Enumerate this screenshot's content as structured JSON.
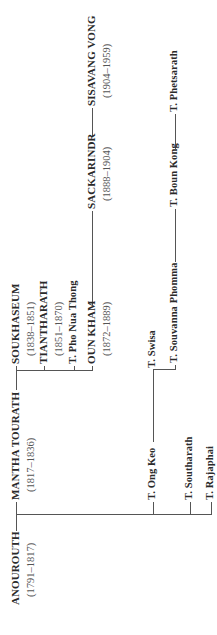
{
  "diagram": {
    "type": "family-tree",
    "orientation": "rotated-90-ccw",
    "line_color": "#555555",
    "text_color": "#2a2a2a",
    "nodes": {
      "anourouth": {
        "name": "ANOUROUTH",
        "dates": "(1791–1817)"
      },
      "mantha_tourath": {
        "name": "MANTHA TOURATH",
        "dates": "(1817–1836)"
      },
      "soukhaseum": {
        "name": "SOUKHASEUM",
        "dates": "(1838–1851)"
      },
      "tiantharath": {
        "name": "TIANTHARATH",
        "dates": "(1851–1870)"
      },
      "pho_nua_thong": {
        "name": "T. Pho Nua Thong"
      },
      "oun_kham": {
        "name": "OUN KHAM",
        "dates": "(1872–1889)"
      },
      "sackarindr": {
        "name": "SACKARINDR",
        "dates": "(1888–1904)"
      },
      "sisavang_vong": {
        "name": "SISAVANG VONG",
        "dates": "(1904–1959)"
      },
      "ong_keo": {
        "name": "T. Ong Keo"
      },
      "swisa": {
        "name": "T. Swisa"
      },
      "souvanna_phomma": {
        "name": "T. Souvanna Phomma"
      },
      "boun_kong": {
        "name": "T. Boun Kong"
      },
      "phetsarath": {
        "name": "T. Phetsarath"
      },
      "southarath": {
        "name": "T. Southarath"
      },
      "rajaphai": {
        "name": "T. Rajaphai"
      }
    },
    "edges": [
      [
        "anourouth",
        "mantha_tourath"
      ],
      [
        "anourouth",
        "ong_keo"
      ],
      [
        "anourouth",
        "southarath"
      ],
      [
        "anourouth",
        "rajaphai"
      ],
      [
        "mantha_tourath",
        "soukhaseum"
      ],
      [
        "mantha_tourath",
        "tiantharath"
      ],
      [
        "mantha_tourath",
        "pho_nua_thong"
      ],
      [
        "mantha_tourath",
        "oun_kham"
      ],
      [
        "oun_kham",
        "sackarindr"
      ],
      [
        "sackarindr",
        "sisavang_vong"
      ],
      [
        "ong_keo",
        "swisa"
      ],
      [
        "ong_keo",
        "souvanna_phomma"
      ],
      [
        "souvanna_phomma",
        "boun_kong"
      ],
      [
        "boun_kong",
        "phetsarath"
      ]
    ]
  }
}
